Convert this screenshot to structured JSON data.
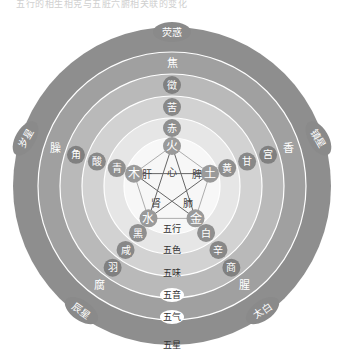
{
  "caption": "五行的相生相克与五脏六腑相关联的变化",
  "center": {
    "x": 172,
    "y": 186
  },
  "rings": [
    {
      "name": "五星",
      "r": 159,
      "color": "#8e8e8e"
    },
    {
      "name": "五气",
      "r": 134,
      "color": "#a0a0a0"
    },
    {
      "name": "五音",
      "r": 112,
      "color": "#b9b9b9"
    },
    {
      "name": "五味",
      "r": 90,
      "color": "#d2d2d2"
    },
    {
      "name": "五色",
      "r": 68,
      "color": "#e6e6e6"
    },
    {
      "name": "五行",
      "r": 48,
      "color": "#f7f7f7"
    }
  ],
  "ring_labels": [
    "五行",
    "五色",
    "五味",
    "五音",
    "五气",
    "五星"
  ],
  "elements": {
    "fire": {
      "xing": "火",
      "zang": "心",
      "se": "赤",
      "wei": "苦",
      "yin": "徵",
      "qi": "焦",
      "star": "荧惑"
    },
    "earth": {
      "xing": "土",
      "zang": "脾",
      "se": "黄",
      "wei": "甘",
      "yin": "宫",
      "qi": "香",
      "star": "镇星"
    },
    "metal": {
      "xing": "金",
      "zang": "肺",
      "se": "白",
      "wei": "辛",
      "yin": "商",
      "qi": "腥",
      "star": "太白"
    },
    "water": {
      "xing": "水",
      "zang": "肾",
      "se": "黑",
      "wei": "咸",
      "yin": "羽",
      "qi": "腐",
      "star": "辰星"
    },
    "wood": {
      "xing": "木",
      "zang": "肝",
      "se": "青",
      "wei": "酸",
      "yin": "角",
      "qi": "臊",
      "star": "岁星"
    }
  }
}
